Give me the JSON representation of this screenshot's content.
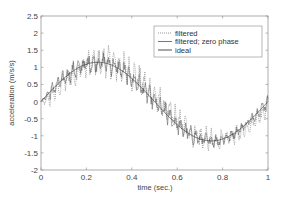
{
  "chart_data": {
    "type": "line",
    "title": "",
    "xlabel": "time (sec.)",
    "ylabel": "acceleration (m/s/s)",
    "xlim": [
      0,
      1
    ],
    "ylim": [
      -2,
      2.5
    ],
    "xticks": [
      0,
      0.2,
      0.4,
      0.6,
      0.8,
      1
    ],
    "xtick_labels": [
      "0",
      "0.2",
      "0.4",
      "0.6",
      "0.8",
      "1"
    ],
    "yticks": [
      -2,
      -1.5,
      -1,
      -0.5,
      0,
      0.5,
      1,
      1.5,
      2,
      2.5
    ],
    "ytick_labels": [
      "-2",
      "-1.5",
      "-1",
      "-0.5",
      "0",
      "0.5",
      "1",
      "1.5",
      "2",
      "2.5"
    ],
    "grid": false,
    "legend_position": "upper right",
    "series": [
      {
        "name": "filtered",
        "style": "dotted",
        "color": "#777777",
        "noise_amplitude": 0.55
      },
      {
        "name": "filtered; zero phase",
        "style": "solid",
        "color": "#555555",
        "noise_amplitude": 0.35
      },
      {
        "name": "ideal",
        "style": "solid",
        "color": "#222222",
        "noise_amplitude": 0
      }
    ],
    "ideal_model": {
      "amplitude": 1.15,
      "frequency_hz": 1.0,
      "offset": 0.0
    },
    "x": [
      0,
      0.05,
      0.1,
      0.15,
      0.2,
      0.25,
      0.3,
      0.35,
      0.4,
      0.45,
      0.5,
      0.55,
      0.6,
      0.65,
      0.7,
      0.75,
      0.8,
      0.85,
      0.9,
      0.95,
      1.0
    ],
    "ideal_values": [
      0.0,
      0.36,
      0.68,
      0.93,
      1.09,
      1.15,
      1.09,
      0.93,
      0.68,
      0.36,
      0.0,
      -0.36,
      -0.68,
      -0.93,
      -1.09,
      -1.15,
      -1.09,
      -0.93,
      -0.68,
      -0.36,
      0.0
    ],
    "approx_peaks": {
      "max_filtered": 2.0,
      "max_at_time": 0.31,
      "min_filtered": -1.4,
      "min_at_time": 0.75
    }
  },
  "legend": {
    "items": [
      {
        "label": "filtered"
      },
      {
        "label": "filtered; zero phase"
      },
      {
        "label": "ideal"
      }
    ]
  }
}
